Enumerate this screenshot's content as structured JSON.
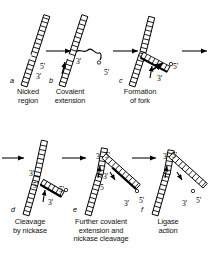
{
  "figure": {
    "background": "#ffffff",
    "ink": "#000000",
    "rows": 2,
    "columns": 3
  },
  "panels": [
    {
      "id": "a",
      "letter": "a",
      "caption": "Nicked\nregion",
      "end_labels": [
        {
          "text": "5'",
          "x": 40,
          "y": 62
        },
        {
          "text": "3'",
          "x": 36,
          "y": 72
        }
      ]
    },
    {
      "id": "b",
      "letter": "b",
      "caption": "Covalent\nextension",
      "end_labels": [
        {
          "text": "3'",
          "x": 76,
          "y": 57
        },
        {
          "text": "5'",
          "x": 104,
          "y": 68
        }
      ]
    },
    {
      "id": "c",
      "letter": "c",
      "caption": "Formation\nof fork",
      "end_labels": [
        {
          "text": "5'",
          "x": 173,
          "y": 62
        },
        {
          "text": "3'",
          "x": 157,
          "y": 74
        }
      ]
    },
    {
      "id": "d",
      "letter": "d",
      "caption": "Cleavage\nby nickase",
      "end_labels": [
        {
          "text": "3'",
          "x": 29,
          "y": 169
        },
        {
          "text": "5'",
          "x": 33,
          "y": 181
        },
        {
          "text": "5'",
          "x": 59,
          "y": 185
        },
        {
          "text": "3'",
          "x": 48,
          "y": 198
        }
      ]
    },
    {
      "id": "e",
      "letter": "e",
      "caption": "Further covalent\nextension and\nnickase cleavage",
      "end_labels": [
        {
          "text": "3'",
          "x": 96,
          "y": 152
        },
        {
          "text": "5'",
          "x": 105,
          "y": 151
        },
        {
          "text": "3'",
          "x": 103,
          "y": 172
        },
        {
          "text": "5",
          "x": 100,
          "y": 183
        },
        {
          "text": "3'",
          "x": 124,
          "y": 199
        },
        {
          "text": "5'",
          "x": 139,
          "y": 196
        }
      ]
    },
    {
      "id": "f",
      "letter": "f",
      "caption": "Ligase\naction",
      "end_labels": [
        {
          "text": "3'",
          "x": 163,
          "y": 152
        },
        {
          "text": "5'",
          "x": 172,
          "y": 151
        },
        {
          "text": "3'",
          "x": 182,
          "y": 199
        },
        {
          "text": "5'",
          "x": 196,
          "y": 196
        }
      ]
    }
  ],
  "arrows": [
    {
      "name": "arrow-a-to-b",
      "x1": 46,
      "y1": 51,
      "x2": 71,
      "y2": 51
    },
    {
      "name": "arrow-b-to-c",
      "x1": 113,
      "y1": 51,
      "x2": 138,
      "y2": 51
    },
    {
      "name": "arrow-c-to-next-row",
      "x1": 182,
      "y1": 51,
      "x2": 207,
      "y2": 51
    },
    {
      "name": "arrow-into-d",
      "x1": 2,
      "y1": 158,
      "x2": 24,
      "y2": 158
    },
    {
      "name": "arrow-d-to-e",
      "x1": 62,
      "y1": 158,
      "x2": 86,
      "y2": 158
    },
    {
      "name": "arrow-e-to-f",
      "x1": 132,
      "y1": 158,
      "x2": 156,
      "y2": 158
    }
  ],
  "captions": {
    "a": "Nicked\nregion",
    "b": "Covalent\nextension",
    "c": "Formation\nof fork",
    "d": "Cleavage\nby nickase",
    "e": "Further covalent\nextension and\nnickase cleavage",
    "f": "Ligase\naction"
  },
  "chart_data": {
    "type": "diagram",
    "steps": [
      {
        "step": "a",
        "label": "Nicked region"
      },
      {
        "step": "b",
        "label": "Covalent extension"
      },
      {
        "step": "c",
        "label": "Formation of fork"
      },
      {
        "step": "d",
        "label": "Cleavage by nickase"
      },
      {
        "step": "e",
        "label": "Further covalent extension and nickase cleavage"
      },
      {
        "step": "f",
        "label": "Ligase action"
      }
    ]
  }
}
